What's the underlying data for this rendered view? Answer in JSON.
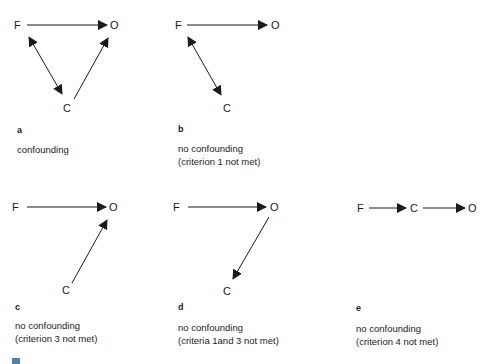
{
  "panels": [
    {
      "letter": "a",
      "caption_line1": "confounding",
      "caption_line2": "",
      "nodes": {
        "F": "F",
        "O": "O",
        "C": "C"
      }
    },
    {
      "letter": "b",
      "caption_line1": "no confounding",
      "caption_line2": "(criterion 1 not met)",
      "nodes": {
        "F": "F",
        "O": "O",
        "C": "C"
      }
    },
    {
      "letter": "c",
      "caption_line1": "no confounding",
      "caption_line2": "(criterion 3 not met)",
      "nodes": {
        "F": "F",
        "O": "O",
        "C": "C"
      }
    },
    {
      "letter": "d",
      "caption_line1": "no confounding",
      "caption_line2": "(criteria 1and 3 not met)",
      "nodes": {
        "F": "F",
        "O": "O",
        "C": "C"
      }
    },
    {
      "letter": "e",
      "caption_line1": "no confounding",
      "caption_line2": "(criterion 4 not met)",
      "nodes": {
        "F": "F",
        "O": "O",
        "C": "C"
      }
    }
  ],
  "colors": {
    "ink": "#1a1a1a",
    "corner_mark": "#4a7fc1"
  }
}
